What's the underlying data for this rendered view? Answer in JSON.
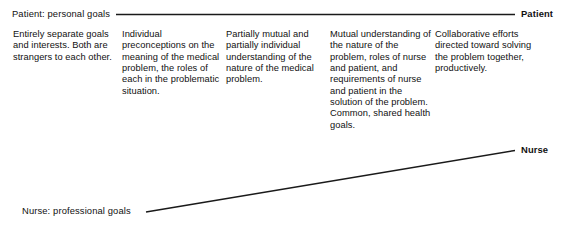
{
  "figure": {
    "type": "diagram",
    "subtype": "convergence-diagram"
  },
  "axes": {
    "patient": {
      "start_label": "Patient: personal goals",
      "end_label": "Patient"
    },
    "nurse": {
      "start_label": "Nurse: professional goals",
      "end_label": "Nurse"
    }
  },
  "stages": [
    {
      "index": 1,
      "text": "Entirely separate goals and interests. Both are strangers to each other."
    },
    {
      "index": 2,
      "text": "Individual preconceptions on the meaning of the medical problem, the roles of each in the problematic situation."
    },
    {
      "index": 3,
      "text": "Partially mutual and partially individual understanding of the nature of the medical problem."
    },
    {
      "index": 4,
      "text": "Mutual understanding of the nature of the problem, roles of nurse and patient, and requirements of nurse and patient in the solution of the problem. Common, shared health goals."
    },
    {
      "index": 5,
      "text": "Collaborative efforts directed toward solving the problem together, productively."
    }
  ],
  "colors": {
    "line": "#1a1a1a",
    "text": "#111111",
    "background": "#ffffff"
  }
}
